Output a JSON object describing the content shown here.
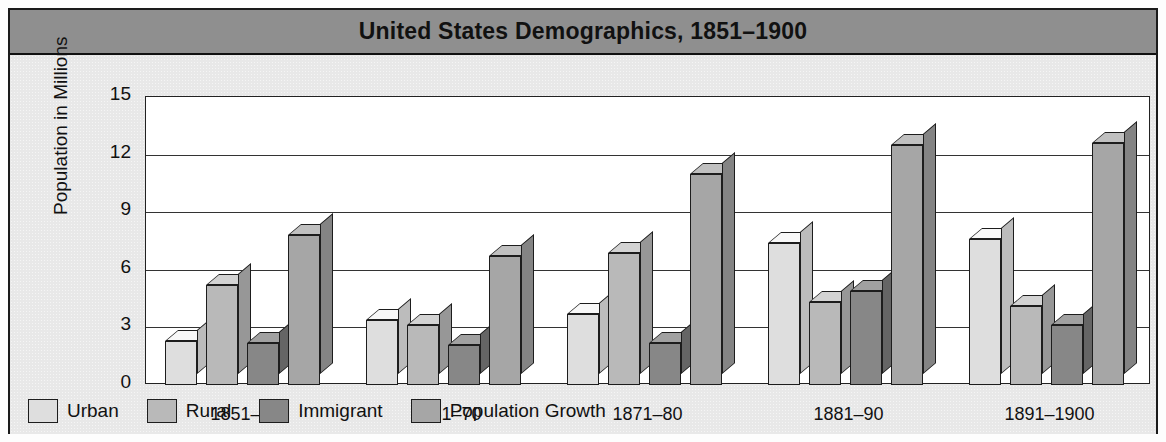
{
  "figure": {
    "title": "United States Demographics, 1851–1900"
  },
  "axes": {
    "ylabel": "Population in Millions",
    "xlabel": "Year",
    "yticks": [
      "15",
      "12",
      "9",
      "6",
      "3",
      "0"
    ]
  },
  "legend": {
    "items": [
      {
        "label": "Urban",
        "color": "#dedede"
      },
      {
        "label": "Rural",
        "color": "#b9b9b9"
      },
      {
        "label": "Immigrant",
        "color": "#878787"
      },
      {
        "label": "Population Growth",
        "color": "#a6a6a6"
      }
    ]
  },
  "colors": {
    "title_band": "#8f8f8f",
    "body": "#e8e8e8",
    "plot_bg": "#ffffff",
    "outline": "#1d1d1d",
    "shadow": "#d2d2d2"
  },
  "chart_data": {
    "type": "bar",
    "title": "United States Demographics, 1851–1900",
    "xlabel": "Year",
    "ylabel": "Population in Millions",
    "categories": [
      "1851–60",
      "1861–70",
      "1871–80",
      "1881–90",
      "1891–1900"
    ],
    "series": [
      {
        "name": "Urban",
        "color": "#dedede",
        "values": [
          2.3,
          3.4,
          3.7,
          7.4,
          7.6
        ]
      },
      {
        "name": "Rural",
        "color": "#b9b9b9",
        "values": [
          5.2,
          3.1,
          6.9,
          4.3,
          4.1
        ]
      },
      {
        "name": "Immigrant",
        "color": "#878787",
        "values": [
          2.2,
          2.1,
          2.2,
          4.9,
          3.1
        ]
      },
      {
        "name": "Population Growth",
        "color": "#a6a6a6",
        "values": [
          7.8,
          6.7,
          11.0,
          12.5,
          12.6
        ]
      }
    ],
    "ylim": [
      0,
      15
    ],
    "ytick_values": [
      0,
      3,
      6,
      9,
      12,
      15
    ],
    "grid": true,
    "legend_position": "bottom-left",
    "style": "3d-columns"
  }
}
